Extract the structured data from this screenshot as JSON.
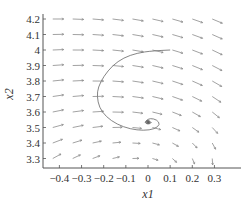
{
  "chart_data": {
    "type": "quiver",
    "title": "",
    "xlabel": "x1",
    "ylabel": "x2",
    "xlim": [
      -0.47,
      0.39
    ],
    "ylim": [
      3.25,
      4.22
    ],
    "grid": false,
    "x_ticks": [
      -0.4,
      -0.3,
      -0.2,
      -0.1,
      0,
      0.1,
      0.2,
      0.3
    ],
    "x_tick_labels": [
      "−0.4",
      "−0.3",
      "−0.2",
      "−0.1",
      "0",
      "0.1",
      "0.2",
      "0.3"
    ],
    "y_ticks": [
      3.3,
      3.4,
      3.5,
      3.6,
      3.7,
      3.8,
      3.9,
      4.0,
      4.1,
      4.2
    ],
    "y_tick_labels": [
      "3.3",
      "3.4",
      "3.5",
      "3.6",
      "3.7",
      "3.8",
      "3.9",
      "4",
      "4.1",
      "4.2"
    ],
    "vector_field": {
      "description": "Phase-plane direction field, roughly 8 columns x 9 rows of short gray arrows; vectors near the top point right/down-right, vectors at lower left point down-right, converging toward a stable focus near (0, 3.53).",
      "grid_x": [
        -0.43,
        -0.34,
        -0.25,
        -0.16,
        -0.07,
        0.02,
        0.11,
        0.2,
        0.29
      ],
      "grid_y": [
        3.3,
        3.4,
        3.5,
        3.6,
        3.7,
        3.8,
        3.9,
        4.0,
        4.1,
        4.2
      ]
    },
    "trajectory": {
      "name": "solution curve",
      "description": "Spiral trajectory from about (0.1, 4.0) sweeping left to x1 ≈ -0.23, down to x2 ≈ 3.5 and spiralling into the equilibrium near (0, 3.53).",
      "points": [
        [
          0.1,
          4.0
        ],
        [
          0.02,
          3.995
        ],
        [
          -0.05,
          3.98
        ],
        [
          -0.11,
          3.95
        ],
        [
          -0.16,
          3.9
        ],
        [
          -0.2,
          3.83
        ],
        [
          -0.225,
          3.76
        ],
        [
          -0.23,
          3.7
        ],
        [
          -0.22,
          3.63
        ],
        [
          -0.19,
          3.57
        ],
        [
          -0.14,
          3.52
        ],
        [
          -0.08,
          3.49
        ],
        [
          -0.02,
          3.48
        ],
        [
          0.03,
          3.49
        ],
        [
          0.055,
          3.52
        ],
        [
          0.04,
          3.55
        ],
        [
          0.01,
          3.56
        ],
        [
          -0.01,
          3.545
        ],
        [
          0.0,
          3.53
        ],
        [
          0.01,
          3.535
        ],
        [
          0.0,
          3.538
        ]
      ]
    },
    "equilibrium": {
      "x": 0.0,
      "y": 3.535
    }
  },
  "colors": {
    "axis": "#555555",
    "arrow": "#8a8a8a",
    "trajectory": "#777777",
    "text": "#333333"
  }
}
